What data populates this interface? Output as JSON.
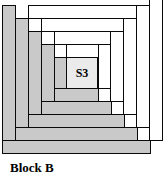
{
  "figure": {
    "caption": "Block B",
    "center": {
      "label": "S3"
    },
    "colors": {
      "gray_fabric": "#c9c9c9",
      "white_fabric": "#ffffff",
      "center_fabric": "#ebebeb",
      "outline": "#0a0a0a",
      "background": "#ffffff"
    },
    "diagram_type": "log-cabin quilt block",
    "center_rect": {
      "x": 56,
      "y": 46,
      "w": 32,
      "h": 32
    },
    "logs": [
      {
        "name": "log-1-gray-left",
        "shade": "gray",
        "x": 44,
        "y": 46,
        "w": 13,
        "h": 45
      },
      {
        "name": "log-2-gray-bottom",
        "shade": "gray",
        "x": 44,
        "y": 77,
        "w": 45,
        "h": 14
      },
      {
        "name": "log-3-white-top",
        "shade": "white",
        "x": 56,
        "y": 33,
        "w": 45,
        "h": 14
      },
      {
        "name": "log-4-white-right",
        "shade": "white",
        "x": 88,
        "y": 33,
        "w": 13,
        "h": 45
      },
      {
        "name": "log-5-gray-left",
        "shade": "gray",
        "x": 31,
        "y": 33,
        "w": 14,
        "h": 71
      },
      {
        "name": "log-6-gray-bottom",
        "shade": "gray",
        "x": 31,
        "y": 90,
        "w": 71,
        "h": 14
      },
      {
        "name": "log-7-white-top",
        "shade": "white",
        "x": 44,
        "y": 20,
        "w": 70,
        "h": 14
      },
      {
        "name": "log-8-white-right",
        "shade": "white",
        "x": 100,
        "y": 20,
        "w": 14,
        "h": 71
      },
      {
        "name": "log-9-gray-left",
        "shade": "gray",
        "x": 18,
        "y": 20,
        "w": 14,
        "h": 97
      },
      {
        "name": "log-10-gray-bottom",
        "shade": "gray",
        "x": 18,
        "y": 103,
        "w": 97,
        "h": 14
      },
      {
        "name": "log-11-white-top",
        "shade": "white",
        "x": 31,
        "y": 7,
        "w": 96,
        "h": 14
      },
      {
        "name": "log-12-white-right",
        "shade": "white",
        "x": 113,
        "y": 7,
        "w": 14,
        "h": 97
      },
      {
        "name": "log-13-gray-left",
        "shade": "gray",
        "x": 5,
        "y": 7,
        "w": 14,
        "h": 123
      },
      {
        "name": "log-14-gray-bottom",
        "shade": "gray",
        "x": 5,
        "y": 116,
        "w": 123,
        "h": 14
      },
      {
        "name": "log-15-white-top",
        "shade": "white",
        "x": 18,
        "y": -6,
        "w": 122,
        "h": 14
      },
      {
        "name": "log-16-white-right",
        "shade": "white",
        "x": 126,
        "y": -6,
        "w": 14,
        "h": 123
      },
      {
        "name": "log-17-gray-left",
        "shade": "gray",
        "x": -8,
        "y": -6,
        "w": 14,
        "h": 149
      },
      {
        "name": "log-18-gray-bottom",
        "shade": "gray",
        "x": -8,
        "y": 129,
        "w": 149,
        "h": 14
      },
      {
        "name": "log-19-white-right",
        "shade": "white",
        "x": 139,
        "y": -19,
        "w": 14,
        "h": 149
      }
    ]
  }
}
